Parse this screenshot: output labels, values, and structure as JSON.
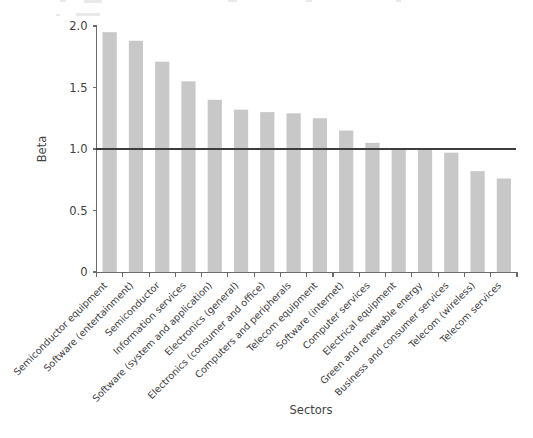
{
  "chart_data": {
    "type": "bar",
    "title": "",
    "xlabel": "Sectors",
    "ylabel": "Beta",
    "ylim": [
      0,
      2.0
    ],
    "yticks": [
      0,
      0.5,
      1.0,
      1.5,
      2.0
    ],
    "ytick_labels": [
      "0",
      "0.5",
      "1.0",
      "1.5",
      "2.0"
    ],
    "grid": false,
    "legend": null,
    "bar_color": "#c8c8c8",
    "reference_line": {
      "value": 1.0,
      "color": "#3d3d3d",
      "orientation": "horizontal"
    },
    "categories": [
      "Semiconductor equipment",
      "Software (entertainment)",
      "Semiconductor",
      "Information services",
      "Software (system and application)",
      "Electronics (general)",
      "Electronics (consumer and office)",
      "Computers and peripherals",
      "Telecom equipment",
      "Software (internet)",
      "Computer services",
      "Electrical equipment",
      "Green and renewable energy",
      "Business and consumer services",
      "Telecom (wireless)",
      "Telecom services"
    ],
    "values": [
      1.95,
      1.88,
      1.71,
      1.55,
      1.4,
      1.32,
      1.3,
      1.29,
      1.25,
      1.15,
      1.05,
      1.0,
      1.0,
      0.97,
      0.82,
      0.76
    ]
  },
  "axes": {
    "y_axis_label": "Beta",
    "x_axis_label": "Sectors"
  }
}
